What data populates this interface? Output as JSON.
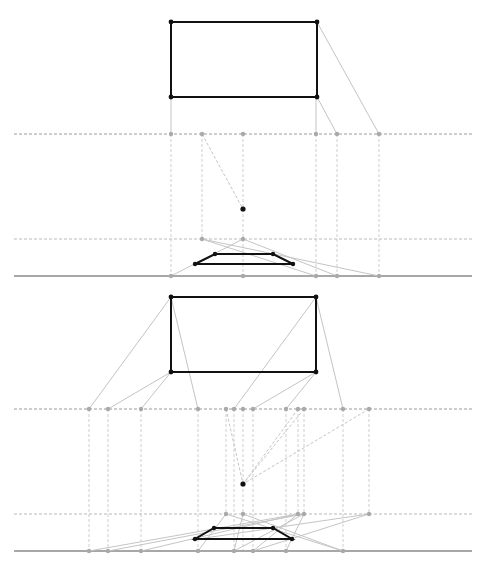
{
  "colors": {
    "object": "#111111",
    "construction": "#c4c4c4",
    "points": "#a9a9a9",
    "ground": "#8a8a8a"
  },
  "panels": [
    {
      "name": "top-panel",
      "picture_plane_rect": {
        "x1": 171,
        "y1": 22,
        "x2": 317,
        "y2": 97
      },
      "horizon_y": 134,
      "mid_line_y": 239,
      "ground_y": 276,
      "line_extent": [
        14,
        472
      ],
      "eye_point": {
        "x": 243,
        "y": 209
      },
      "horizon_points_x": [
        171,
        202,
        243,
        316,
        337,
        379
      ],
      "mid_points": [
        [
          202,
          239
        ],
        [
          243,
          239
        ]
      ],
      "ground_points_x": [
        171,
        243,
        316,
        337,
        379
      ],
      "trapezoid": [
        [
          215,
          254
        ],
        [
          273,
          254
        ],
        [
          293,
          264
        ],
        [
          195,
          264
        ]
      ],
      "rays": [
        [
          317,
          22,
          379,
          134
        ],
        [
          317,
          97,
          337,
          134
        ],
        [
          171,
          97,
          171,
          134
        ],
        [
          316,
          97,
          316,
          134
        ],
        [
          171,
          276,
          243,
          239
        ],
        [
          202,
          239,
          316,
          276
        ],
        [
          202,
          239,
          379,
          276
        ],
        [
          243,
          239,
          337,
          276
        ]
      ],
      "dashed_rays": [
        [
          202,
          134,
          243,
          209
        ]
      ],
      "verticals": [
        [
          171,
          134,
          276
        ],
        [
          202,
          134,
          239
        ],
        [
          243,
          134,
          276
        ],
        [
          316,
          134,
          276
        ],
        [
          337,
          134,
          276
        ],
        [
          379,
          134,
          276
        ]
      ]
    },
    {
      "name": "bottom-panel",
      "picture_plane_rect": {
        "x1": 171,
        "y1": 297,
        "x2": 316,
        "y2": 372
      },
      "horizon_y": 409,
      "mid_line_y": 514,
      "ground_y": 551,
      "line_extent": [
        14,
        472
      ],
      "eye_point": {
        "x": 243,
        "y": 484
      },
      "horizon_points_x": [
        89,
        108,
        141,
        198,
        226,
        234,
        243,
        253,
        286,
        298,
        304,
        343,
        369
      ],
      "mid_points": [
        [
          226,
          514
        ],
        [
          243,
          514
        ],
        [
          298,
          514
        ],
        [
          304,
          514
        ],
        [
          369,
          514
        ]
      ],
      "ground_points_x": [
        89,
        108,
        141,
        198,
        234,
        253,
        286,
        343
      ],
      "trapezoid": [
        [
          214,
          528
        ],
        [
          273,
          528
        ],
        [
          292,
          539
        ],
        [
          195,
          539
        ]
      ],
      "rays": [
        [
          171,
          297,
          89,
          409
        ],
        [
          171,
          297,
          198,
          409
        ],
        [
          171,
          372,
          108,
          409
        ],
        [
          171,
          372,
          141,
          409
        ],
        [
          316,
          297,
          234,
          409
        ],
        [
          316,
          297,
          343,
          409
        ],
        [
          316,
          372,
          253,
          409
        ],
        [
          316,
          372,
          286,
          409
        ],
        [
          89,
          551,
          298,
          514
        ],
        [
          108,
          551,
          304,
          514
        ],
        [
          141,
          551,
          298,
          514
        ],
        [
          198,
          551,
          226,
          514
        ],
        [
          234,
          551,
          304,
          514
        ],
        [
          253,
          551,
          369,
          514
        ],
        [
          226,
          514,
          343,
          551
        ],
        [
          243,
          514,
          343,
          551
        ],
        [
          304,
          514,
          286,
          551
        ],
        [
          369,
          514,
          198,
          539
        ],
        [
          243,
          514,
          234,
          551
        ],
        [
          298,
          514,
          253,
          551
        ]
      ],
      "dashed_rays": [
        [
          226,
          409,
          243,
          484
        ],
        [
          298,
          409,
          243,
          484
        ],
        [
          304,
          409,
          243,
          484
        ],
        [
          369,
          409,
          243,
          484
        ]
      ],
      "verticals": [
        [
          89,
          409,
          551
        ],
        [
          108,
          409,
          551
        ],
        [
          141,
          409,
          551
        ],
        [
          198,
          409,
          551
        ],
        [
          226,
          409,
          514
        ],
        [
          234,
          409,
          551
        ],
        [
          243,
          409,
          551
        ],
        [
          253,
          409,
          551
        ],
        [
          286,
          409,
          551
        ],
        [
          298,
          409,
          514
        ],
        [
          304,
          409,
          514
        ],
        [
          343,
          409,
          551
        ],
        [
          369,
          409,
          514
        ]
      ]
    }
  ]
}
